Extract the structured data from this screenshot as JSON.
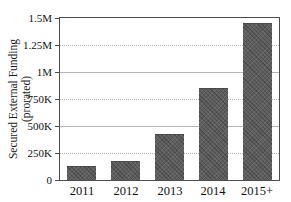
{
  "chart_data": {
    "type": "bar",
    "title": "",
    "categories": [
      "2011",
      "2012",
      "2013",
      "2014",
      "2015+"
    ],
    "values": [
      125000,
      175000,
      425000,
      850000,
      1450000
    ],
    "ylabel": "Secured External Funding (prorated)",
    "ylabel_line1": "Secured External Funding",
    "ylabel_line2": "(prorated)",
    "xlabel": "",
    "ylim": [
      0,
      1500000
    ],
    "yticks": [
      {
        "value": 0,
        "label": "0"
      },
      {
        "value": 250000,
        "label": "250K"
      },
      {
        "value": 500000,
        "label": "500K"
      },
      {
        "value": 750000,
        "label": "750K"
      },
      {
        "value": 1000000,
        "label": "1M"
      },
      {
        "value": 1250000,
        "label": "1.25M"
      },
      {
        "value": 1500000,
        "label": "1.5M"
      }
    ],
    "grid": "horizontal",
    "legend": "none",
    "colors": {
      "bar": "#5e5e5e",
      "grid": "#b6b6b6",
      "frame": "#4c4c4c",
      "text": "#111111",
      "background": "#ffffff"
    }
  }
}
